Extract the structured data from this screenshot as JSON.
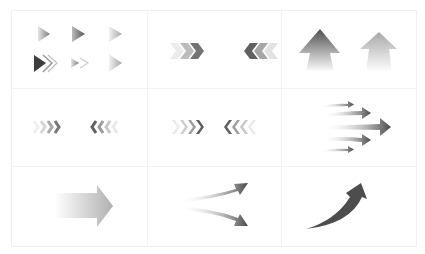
{
  "sheet": {
    "title": "Arrow icon set",
    "grid": {
      "rows": 3,
      "cols": 3
    },
    "colors": {
      "dark": "#4a4a4a",
      "mid": "#8a8a8a",
      "light": "#d0d0d0",
      "grid": "#f2f2f2",
      "background": "#ffffff"
    },
    "cells": [
      {
        "id": "small-triangle-arrows",
        "row": 0,
        "col": 0,
        "description": "six small gradient right-pointing triangle arrows in a 3x2 arrangement, one with a double outlined chevron"
      },
      {
        "id": "chevron-pairs-large",
        "row": 0,
        "col": 1,
        "description": "three right chevrons and three left chevrons, fading"
      },
      {
        "id": "up-arrows",
        "row": 0,
        "col": 2,
        "description": "two upward arrows fading to white at the base, dark and light"
      },
      {
        "id": "chevron-quads-small",
        "row": 1,
        "col": 0,
        "description": "four right chevrons and four left chevrons, fading"
      },
      {
        "id": "chevron-quads-thin",
        "row": 1,
        "col": 1,
        "description": "four thin right chevrons and four thin left chevrons, fading"
      },
      {
        "id": "speed-arrows",
        "row": 1,
        "col": 2,
        "description": "five converging motion arrows pointing right, center largest"
      },
      {
        "id": "block-arrow",
        "row": 2,
        "col": 0,
        "description": "wide gray block arrow pointing right, fading at tail"
      },
      {
        "id": "split-arrows",
        "row": 2,
        "col": 1,
        "description": "two curved arrows diverging up-right and down-right"
      },
      {
        "id": "curved-up-arrow",
        "row": 2,
        "col": 2,
        "description": "curved arrow sweeping upward to the right"
      }
    ]
  }
}
